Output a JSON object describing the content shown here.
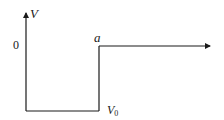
{
  "diagram": {
    "type": "square-well-potential",
    "labels": {
      "y_axis": "V",
      "zero_level": "0",
      "well_edge": "a",
      "well_depth": "V",
      "well_depth_subscript": "0"
    },
    "colors": {
      "line": "#1a1a1a",
      "background": "#ffffff"
    },
    "geometry": {
      "axis_x": 26,
      "axis_top": 12,
      "zero_level_y": 46,
      "well_bottom_y": 111,
      "well_edge_x": 99,
      "arrow_end_x": 210
    }
  }
}
